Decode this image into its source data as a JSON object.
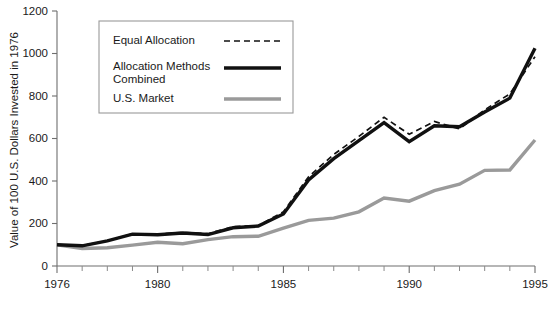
{
  "chart_data": {
    "type": "line",
    "title": "",
    "xlabel": "",
    "ylabel": "Value of 100 U.S. Dollars Invested in 1976",
    "xlim": [
      1976,
      1995
    ],
    "ylim": [
      0,
      1200
    ],
    "ytick_values": [
      0,
      200,
      400,
      600,
      800,
      1000,
      1200
    ],
    "ytick_labels": [
      "0",
      "200",
      "400",
      "600",
      "800",
      "1000",
      "1200"
    ],
    "xtick_values": [
      1976,
      1977,
      1978,
      1979,
      1980,
      1981,
      1982,
      1983,
      1984,
      1985,
      1986,
      1987,
      1988,
      1989,
      1990,
      1991,
      1992,
      1993,
      1994,
      1995
    ],
    "xtick_labels_shown": [
      "1976",
      "1980",
      "1985",
      "1990",
      "1995"
    ],
    "xtick_labeled_values": [
      1976,
      1980,
      1985,
      1990,
      1995
    ],
    "grid": false,
    "legend_position": "top-left-inside",
    "x": [
      1976,
      1977,
      1978,
      1979,
      1980,
      1981,
      1982,
      1983,
      1984,
      1985,
      1986,
      1987,
      1988,
      1989,
      1990,
      1991,
      1992,
      1993,
      1994,
      1995
    ],
    "series": [
      {
        "name": "Equal Allocation",
        "style": "dashed",
        "color": "#111111",
        "values": [
          100,
          97,
          118,
          152,
          150,
          158,
          152,
          185,
          190,
          255,
          420,
          525,
          610,
          700,
          620,
          680,
          645,
          735,
          810,
          985
        ]
      },
      {
        "name": "Allocation Methods Combined",
        "style": "solid-thick",
        "color": "#111111",
        "values": [
          100,
          95,
          118,
          150,
          147,
          155,
          148,
          180,
          188,
          245,
          405,
          505,
          590,
          675,
          585,
          660,
          655,
          725,
          790,
          1025
        ]
      },
      {
        "name": "U.S. Market",
        "style": "solid-thick-gray",
        "color": "#9a9a9a",
        "values": [
          100,
          82,
          86,
          98,
          112,
          105,
          124,
          138,
          140,
          178,
          215,
          225,
          255,
          320,
          305,
          355,
          385,
          450,
          452,
          593
        ]
      }
    ]
  },
  "legend": {
    "items": [
      {
        "label_line1": "Equal Allocation",
        "label_line2": "",
        "style": "dashed"
      },
      {
        "label_line1": "Allocation Methods",
        "label_line2": "Combined",
        "style": "solid-thick"
      },
      {
        "label_line1": "U.S. Market",
        "label_line2": "",
        "style": "solid-thick-gray"
      }
    ]
  }
}
